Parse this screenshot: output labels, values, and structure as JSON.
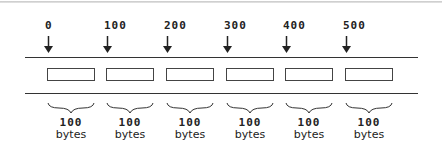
{
  "diagram": {
    "title": "",
    "offsets": [
      "0",
      "100",
      "200",
      "300",
      "400",
      "500"
    ],
    "blocks": [
      {
        "size": "100",
        "unit": "bytes"
      },
      {
        "size": "100",
        "unit": "bytes"
      },
      {
        "size": "100",
        "unit": "bytes"
      },
      {
        "size": "100",
        "unit": "bytes"
      },
      {
        "size": "100",
        "unit": "bytes"
      },
      {
        "size": "100",
        "unit": "bytes"
      }
    ],
    "colors": {
      "line": "#333333",
      "text": "#222222",
      "background": "#ffffff"
    }
  }
}
